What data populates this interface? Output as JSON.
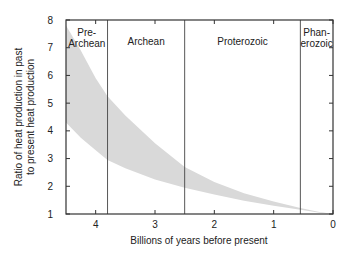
{
  "chart_data": {
    "type": "area",
    "title": "",
    "xlabel": "Billions of years before present",
    "ylabel_lines": [
      "Ratio of heat production in past",
      "to present heat production"
    ],
    "ylabel": "Ratio of heat production in past to present heat production",
    "xlim": [
      4.5,
      0
    ],
    "ylim": [
      1,
      8
    ],
    "x_ticks": [
      4,
      3,
      2,
      1,
      0
    ],
    "y_ticks": [
      1,
      2,
      3,
      4,
      5,
      6,
      7,
      8
    ],
    "grid": false,
    "legend": null,
    "band_color": "#d9d9d9",
    "series": [
      {
        "name": "upper bound",
        "x": [
          4.5,
          4.25,
          4.0,
          3.8,
          3.5,
          3.0,
          2.5,
          2.0,
          1.5,
          1.0,
          0.55,
          0.25,
          0.0
        ],
        "values": [
          7.8,
          6.9,
          5.9,
          5.25,
          4.55,
          3.55,
          2.7,
          2.15,
          1.75,
          1.45,
          1.22,
          1.08,
          1.0
        ]
      },
      {
        "name": "lower bound",
        "x": [
          4.5,
          4.25,
          4.0,
          3.8,
          3.5,
          3.0,
          2.5,
          2.0,
          1.5,
          1.0,
          0.55,
          0.25,
          0.0
        ],
        "values": [
          4.3,
          3.75,
          3.3,
          2.95,
          2.65,
          2.25,
          1.95,
          1.7,
          1.48,
          1.3,
          1.15,
          1.05,
          1.0
        ]
      }
    ],
    "eras": [
      {
        "name": "Pre-Archean",
        "label_lines": [
          "Pre-",
          "Archean"
        ],
        "start": 4.5,
        "end": 3.8
      },
      {
        "name": "Archean",
        "label_lines": [
          "Archean"
        ],
        "start": 3.8,
        "end": 2.5
      },
      {
        "name": "Proterozoic",
        "label_lines": [
          "Proterozoic"
        ],
        "start": 2.5,
        "end": 0.55
      },
      {
        "name": "Phanerozoic",
        "label_lines": [
          "Phan-",
          "erozoic"
        ],
        "start": 0.55,
        "end": 0.0
      }
    ]
  }
}
